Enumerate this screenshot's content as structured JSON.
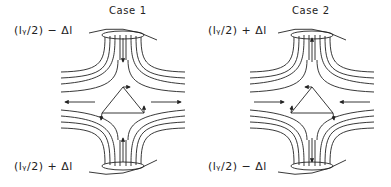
{
  "figure": {
    "panels": [
      {
        "id": "case1",
        "title": "Case 1",
        "top_label": "(l_y/2) − Δl",
        "top_label_display": "(lᵧ/2) − Δl",
        "bottom_label": "(l_y/2) + Δl",
        "bottom_label_display": "(lᵧ/2) + Δl",
        "flow": "inward-vertical, outward-horizontal",
        "vertical_arrows": [
          "down at top",
          "up at bottom"
        ],
        "horizontal_arrows": [
          "left on left side",
          "right on right side"
        ]
      },
      {
        "id": "case2",
        "title": "Case 2",
        "top_label": "(l_y/2) + Δl",
        "top_label_display": "(lᵧ/2) + Δl",
        "bottom_label": "(l_y/2) − Δl",
        "bottom_label_display": "(lᵧ/2) − Δl",
        "flow": "outward-vertical, inward-horizontal",
        "vertical_arrows": [
          "up at top",
          "down at bottom"
        ],
        "horizontal_arrows": [
          "right on left side",
          "left on right side"
        ]
      }
    ],
    "colors": {
      "stroke": "#222222",
      "background": "#ffffff"
    }
  }
}
